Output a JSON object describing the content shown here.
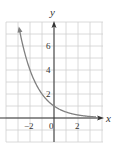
{
  "chart_data": {
    "type": "line",
    "title": "",
    "xlabel": "x",
    "ylabel": "y",
    "xlim": [
      -4,
      4
    ],
    "ylim": [
      -2,
      8
    ],
    "grid": true,
    "legend": null,
    "x_ticks": [
      -2,
      0,
      2
    ],
    "y_ticks": [
      2,
      4,
      6
    ],
    "x_tick_labels": [
      "−2",
      "0",
      "2"
    ],
    "y_tick_labels": [
      "2",
      "4",
      "6"
    ],
    "series": [
      {
        "name": "y = (1/2)^x",
        "color": "#808080",
        "x": [
          -2.9,
          -2.5,
          -2,
          -1.5,
          -1,
          -0.5,
          0,
          0.5,
          1,
          1.5,
          2,
          2.5,
          3,
          3.5
        ],
        "values": [
          7.46,
          5.66,
          4,
          2.83,
          2,
          1.41,
          1,
          0.71,
          0.5,
          0.35,
          0.25,
          0.18,
          0.13,
          0.09
        ]
      }
    ],
    "annotations": [
      "arrowhead on curve at upper-left end",
      "arrowheads on positive x and y axes"
    ]
  },
  "colors": {
    "grid": "#d0d0d0",
    "axis": "#333333",
    "curve": "#808080"
  }
}
